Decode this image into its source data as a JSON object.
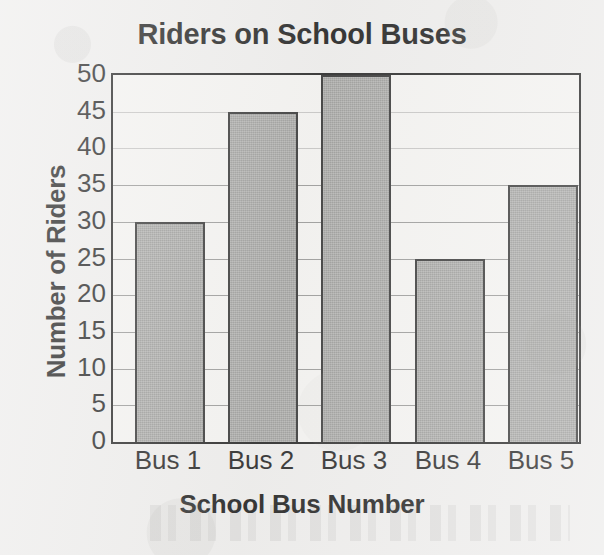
{
  "chart_data": {
    "type": "bar",
    "title": "Riders on School Buses",
    "xlabel": "School Bus Number",
    "ylabel": "Number of Riders",
    "categories": [
      "Bus 1",
      "Bus 2",
      "Bus 3",
      "Bus 4",
      "Bus 5"
    ],
    "values": [
      30,
      45,
      50,
      25,
      35
    ],
    "ylim": [
      0,
      50
    ],
    "ytick_labels": [
      "50",
      "45",
      "40",
      "35",
      "30",
      "25",
      "20",
      "15",
      "10",
      "5",
      "0"
    ],
    "ytick_values": [
      50,
      45,
      40,
      35,
      30,
      25,
      20,
      15,
      10,
      5,
      0
    ],
    "ytick_step": 5,
    "grid": true,
    "legend": false,
    "legend_position": "none",
    "bar_color": "#949492",
    "bar_border_color": "#2b2b2b",
    "plot_background": "#f3f2f0",
    "page_background": "#edeceb",
    "text_color": "#141414",
    "gridline_color": "#6f6f6f"
  }
}
